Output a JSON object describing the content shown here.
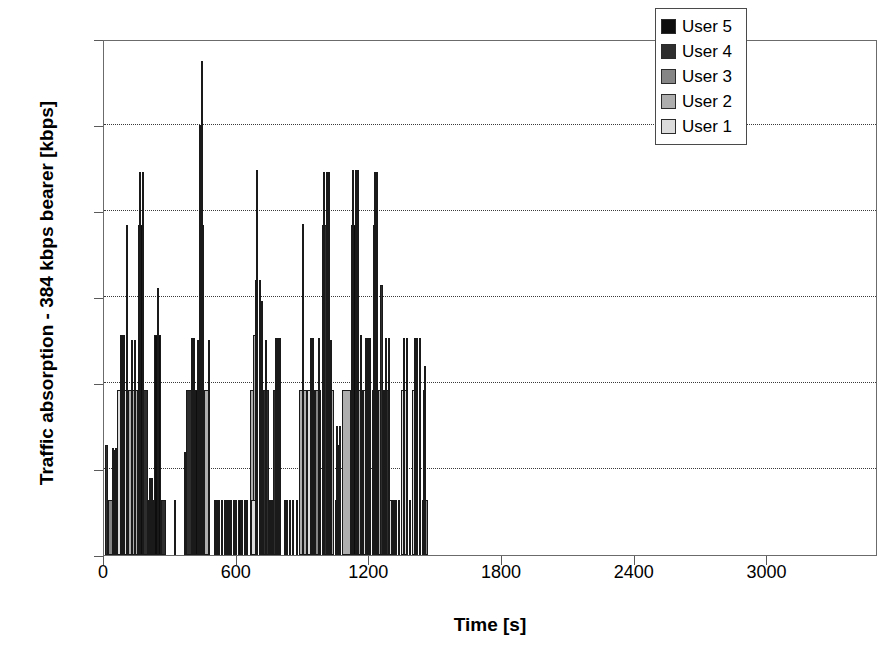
{
  "axes": {
    "ylabel": "Traffic absorption - 384 kbps bearer [kbps]",
    "xlabel": "Time [s]",
    "yticks": [
      "0",
      "200",
      "400",
      "600",
      "800",
      "1000",
      "1200"
    ],
    "xticks": [
      "0",
      "600",
      "1200",
      "1800",
      "2400",
      "3000"
    ]
  },
  "legend": {
    "items": [
      {
        "label": "User 5",
        "color": "#0d0d0d"
      },
      {
        "label": "User 4",
        "color": "#2e2e2e"
      },
      {
        "label": "User 3",
        "color": "#858585"
      },
      {
        "label": "User 2",
        "color": "#aeaeae"
      },
      {
        "label": "User 1",
        "color": "#dcdcdc"
      }
    ]
  },
  "chart_data": {
    "type": "bar",
    "title": "",
    "xlabel": "Time [s]",
    "ylabel": "Traffic absorption - 384 kbps bearer [kbps]",
    "xlim": [
      0,
      3500
    ],
    "ylim": [
      0,
      1200
    ],
    "ytick_step": 200,
    "xtick_step": 600,
    "grid": "horizontal-dotted",
    "legend_position": "top-right",
    "series_names": [
      "User 1",
      "User 2",
      "User 3",
      "User 4",
      "User 5"
    ],
    "series_colors": [
      "#dcdcdc",
      "#aeaeae",
      "#858585",
      "#2e2e2e",
      "#0d0d0d"
    ],
    "value_quantum": 128,
    "note": "Each bar is a time interval; height is aggregate kbps (multiples of 128). Color indicates which user holds the 384 kbps bearer.",
    "bars": [
      {
        "x": 5,
        "w": 14,
        "y": 256,
        "c": "#2e2e2e"
      },
      {
        "x": 12,
        "w": 6,
        "y": 128,
        "c": "#858585"
      },
      {
        "x": 20,
        "w": 30,
        "y": 128,
        "c": "#858585"
      },
      {
        "x": 34,
        "w": 5,
        "y": 250,
        "c": "#0d0d0d"
      },
      {
        "x": 44,
        "w": 4,
        "y": 245,
        "c": "#2e2e2e"
      },
      {
        "x": 52,
        "w": 4,
        "y": 250,
        "c": "#0d0d0d"
      },
      {
        "x": 60,
        "w": 48,
        "y": 384,
        "c": "#dcdcdc"
      },
      {
        "x": 72,
        "w": 5,
        "y": 512,
        "c": "#0d0d0d"
      },
      {
        "x": 80,
        "w": 5,
        "y": 512,
        "c": "#2e2e2e"
      },
      {
        "x": 88,
        "w": 5,
        "y": 512,
        "c": "#0d0d0d"
      },
      {
        "x": 98,
        "w": 5,
        "y": 768,
        "c": "#2e2e2e"
      },
      {
        "x": 108,
        "w": 44,
        "y": 384,
        "c": "#aeaeae"
      },
      {
        "x": 124,
        "w": 5,
        "y": 500,
        "c": "#0d0d0d"
      },
      {
        "x": 134,
        "w": 5,
        "y": 500,
        "c": "#2e2e2e"
      },
      {
        "x": 152,
        "w": 26,
        "y": 768,
        "c": "#0d0d0d"
      },
      {
        "x": 160,
        "w": 5,
        "y": 890,
        "c": "#0d0d0d"
      },
      {
        "x": 170,
        "w": 5,
        "y": 890,
        "c": "#0d0d0d"
      },
      {
        "x": 178,
        "w": 22,
        "y": 384,
        "c": "#2e2e2e"
      },
      {
        "x": 200,
        "w": 24,
        "y": 128,
        "c": "#0d0d0d"
      },
      {
        "x": 204,
        "w": 5,
        "y": 180,
        "c": "#2e2e2e"
      },
      {
        "x": 212,
        "w": 5,
        "y": 180,
        "c": "#0d0d0d"
      },
      {
        "x": 226,
        "w": 30,
        "y": 512,
        "c": "#0d0d0d"
      },
      {
        "x": 238,
        "w": 6,
        "y": 620,
        "c": "#0d0d0d"
      },
      {
        "x": 258,
        "w": 24,
        "y": 128,
        "c": "#2e2e2e"
      },
      {
        "x": 318,
        "w": 4,
        "y": 128,
        "c": "#858585"
      },
      {
        "x": 360,
        "w": 4,
        "y": 240,
        "c": "#0d0d0d"
      },
      {
        "x": 370,
        "w": 30,
        "y": 384,
        "c": "#2e2e2e"
      },
      {
        "x": 395,
        "w": 5,
        "y": 505,
        "c": "#0d0d0d"
      },
      {
        "x": 404,
        "w": 5,
        "y": 505,
        "c": "#2e2e2e"
      },
      {
        "x": 412,
        "w": 26,
        "y": 384,
        "c": "#0d0d0d"
      },
      {
        "x": 420,
        "w": 5,
        "y": 500,
        "c": "#0d0d0d"
      },
      {
        "x": 432,
        "w": 22,
        "y": 768,
        "c": "#0d0d0d"
      },
      {
        "x": 438,
        "w": 6,
        "y": 1150,
        "c": "#0d0d0d"
      },
      {
        "x": 428,
        "w": 3,
        "y": 1000,
        "c": "#2e2e2e"
      },
      {
        "x": 452,
        "w": 28,
        "y": 384,
        "c": "#aeaeae"
      },
      {
        "x": 470,
        "w": 5,
        "y": 500,
        "c": "#2e2e2e"
      },
      {
        "x": 496,
        "w": 4,
        "y": 128,
        "c": "#0d0d0d"
      },
      {
        "x": 506,
        "w": 4,
        "y": 128,
        "c": "#2e2e2e"
      },
      {
        "x": 516,
        "w": 4,
        "y": 128,
        "c": "#0d0d0d"
      },
      {
        "x": 530,
        "w": 4,
        "y": 128,
        "c": "#2e2e2e"
      },
      {
        "x": 542,
        "w": 4,
        "y": 128,
        "c": "#0d0d0d"
      },
      {
        "x": 552,
        "w": 4,
        "y": 128,
        "c": "#0d0d0d"
      },
      {
        "x": 560,
        "w": 4,
        "y": 128,
        "c": "#2e2e2e"
      },
      {
        "x": 572,
        "w": 4,
        "y": 128,
        "c": "#0d0d0d"
      },
      {
        "x": 582,
        "w": 4,
        "y": 128,
        "c": "#0d0d0d"
      },
      {
        "x": 592,
        "w": 4,
        "y": 128,
        "c": "#2e2e2e"
      },
      {
        "x": 604,
        "w": 14,
        "y": 128,
        "c": "#0d0d0d"
      },
      {
        "x": 620,
        "w": 4,
        "y": 128,
        "c": "#0d0d0d"
      },
      {
        "x": 632,
        "w": 4,
        "y": 128,
        "c": "#2e2e2e"
      },
      {
        "x": 644,
        "w": 4,
        "y": 128,
        "c": "#0d0d0d"
      },
      {
        "x": 660,
        "w": 34,
        "y": 384,
        "c": "#aeaeae"
      },
      {
        "x": 676,
        "w": 22,
        "y": 512,
        "c": "#aeaeae"
      },
      {
        "x": 682,
        "w": 14,
        "y": 640,
        "c": "#aeaeae"
      },
      {
        "x": 686,
        "w": 5,
        "y": 895,
        "c": "#0d0d0d"
      },
      {
        "x": 700,
        "w": 5,
        "y": 640,
        "c": "#2e2e2e"
      },
      {
        "x": 708,
        "w": 5,
        "y": 590,
        "c": "#0d0d0d"
      },
      {
        "x": 664,
        "w": 22,
        "y": 128,
        "c": "#dcdcdc"
      },
      {
        "x": 718,
        "w": 30,
        "y": 384,
        "c": "#2e2e2e"
      },
      {
        "x": 730,
        "w": 5,
        "y": 500,
        "c": "#0d0d0d"
      },
      {
        "x": 744,
        "w": 4,
        "y": 128,
        "c": "#0d0d0d"
      },
      {
        "x": 754,
        "w": 4,
        "y": 128,
        "c": "#2e2e2e"
      },
      {
        "x": 766,
        "w": 30,
        "y": 384,
        "c": "#2e2e2e"
      },
      {
        "x": 774,
        "w": 5,
        "y": 505,
        "c": "#0d0d0d"
      },
      {
        "x": 784,
        "w": 5,
        "y": 505,
        "c": "#0d0d0d"
      },
      {
        "x": 792,
        "w": 5,
        "y": 505,
        "c": "#2e2e2e"
      },
      {
        "x": 812,
        "w": 4,
        "y": 128,
        "c": "#0d0d0d"
      },
      {
        "x": 824,
        "w": 4,
        "y": 128,
        "c": "#2e2e2e"
      },
      {
        "x": 838,
        "w": 4,
        "y": 128,
        "c": "#0d0d0d"
      },
      {
        "x": 852,
        "w": 4,
        "y": 128,
        "c": "#0d0d0d"
      },
      {
        "x": 866,
        "w": 4,
        "y": 128,
        "c": "#2e2e2e"
      },
      {
        "x": 884,
        "w": 36,
        "y": 384,
        "c": "#aeaeae"
      },
      {
        "x": 894,
        "w": 5,
        "y": 770,
        "c": "#858585"
      },
      {
        "x": 920,
        "w": 34,
        "y": 384,
        "c": "#dcdcdc"
      },
      {
        "x": 930,
        "w": 5,
        "y": 505,
        "c": "#0d0d0d"
      },
      {
        "x": 942,
        "w": 5,
        "y": 505,
        "c": "#2e2e2e"
      },
      {
        "x": 956,
        "w": 26,
        "y": 384,
        "c": "#858585"
      },
      {
        "x": 966,
        "w": 5,
        "y": 505,
        "c": "#0d0d0d"
      },
      {
        "x": 984,
        "w": 28,
        "y": 768,
        "c": "#2e2e2e"
      },
      {
        "x": 992,
        "w": 5,
        "y": 890,
        "c": "#0d0d0d"
      },
      {
        "x": 1002,
        "w": 5,
        "y": 890,
        "c": "#0d0d0d"
      },
      {
        "x": 1012,
        "w": 5,
        "y": 890,
        "c": "#2e2e2e"
      },
      {
        "x": 1016,
        "w": 26,
        "y": 384,
        "c": "#aeaeae"
      },
      {
        "x": 1024,
        "w": 5,
        "y": 500,
        "c": "#0d0d0d"
      },
      {
        "x": 1046,
        "w": 22,
        "y": 128,
        "c": "#dcdcdc"
      },
      {
        "x": 1052,
        "w": 12,
        "y": 256,
        "c": "#0d0d0d"
      },
      {
        "x": 1048,
        "w": 4,
        "y": 300,
        "c": "#2e2e2e"
      },
      {
        "x": 1062,
        "w": 4,
        "y": 300,
        "c": "#0d0d0d"
      },
      {
        "x": 1078,
        "w": 40,
        "y": 384,
        "c": "#aeaeae"
      },
      {
        "x": 1118,
        "w": 26,
        "y": 768,
        "c": "#0d0d0d"
      },
      {
        "x": 1122,
        "w": 6,
        "y": 895,
        "c": "#0d0d0d"
      },
      {
        "x": 1136,
        "w": 5,
        "y": 895,
        "c": "#0d0d0d"
      },
      {
        "x": 1146,
        "w": 5,
        "y": 895,
        "c": "#2e2e2e"
      },
      {
        "x": 1150,
        "w": 20,
        "y": 384,
        "c": "#aeaeae"
      },
      {
        "x": 1156,
        "w": 10,
        "y": 512,
        "c": "#0d0d0d"
      },
      {
        "x": 1172,
        "w": 28,
        "y": 384,
        "c": "#dcdcdc"
      },
      {
        "x": 1180,
        "w": 5,
        "y": 505,
        "c": "#0d0d0d"
      },
      {
        "x": 1190,
        "w": 5,
        "y": 505,
        "c": "#2e2e2e"
      },
      {
        "x": 1200,
        "w": 5,
        "y": 505,
        "c": "#0d0d0d"
      },
      {
        "x": 1210,
        "w": 30,
        "y": 384,
        "c": "#dcdcdc"
      },
      {
        "x": 1218,
        "w": 18,
        "y": 768,
        "c": "#858585"
      },
      {
        "x": 1222,
        "w": 5,
        "y": 890,
        "c": "#858585"
      },
      {
        "x": 1232,
        "w": 5,
        "y": 890,
        "c": "#858585"
      },
      {
        "x": 1240,
        "w": 26,
        "y": 384,
        "c": "#aeaeae"
      },
      {
        "x": 1246,
        "w": 14,
        "y": 628,
        "c": "#2e2e2e"
      },
      {
        "x": 1266,
        "w": 24,
        "y": 384,
        "c": "#2e2e2e"
      },
      {
        "x": 1272,
        "w": 5,
        "y": 505,
        "c": "#0d0d0d"
      },
      {
        "x": 1284,
        "w": 5,
        "y": 505,
        "c": "#2e2e2e"
      },
      {
        "x": 1290,
        "w": 22,
        "y": 128,
        "c": "#dcdcdc"
      },
      {
        "x": 1298,
        "w": 4,
        "y": 128,
        "c": "#0d0d0d"
      },
      {
        "x": 1306,
        "w": 4,
        "y": 128,
        "c": "#2e2e2e"
      },
      {
        "x": 1314,
        "w": 4,
        "y": 128,
        "c": "#0d0d0d"
      },
      {
        "x": 1330,
        "w": 4,
        "y": 128,
        "c": "#0d0d0d"
      },
      {
        "x": 1344,
        "w": 30,
        "y": 384,
        "c": "#dcdcdc"
      },
      {
        "x": 1352,
        "w": 5,
        "y": 505,
        "c": "#0d0d0d"
      },
      {
        "x": 1366,
        "w": 5,
        "y": 505,
        "c": "#2e2e2e"
      },
      {
        "x": 1378,
        "w": 4,
        "y": 128,
        "c": "#0d0d0d"
      },
      {
        "x": 1392,
        "w": 30,
        "y": 384,
        "c": "#dcdcdc"
      },
      {
        "x": 1400,
        "w": 5,
        "y": 505,
        "c": "#0d0d0d"
      },
      {
        "x": 1412,
        "w": 5,
        "y": 505,
        "c": "#2e2e2e"
      },
      {
        "x": 1424,
        "w": 5,
        "y": 505,
        "c": "#0d0d0d"
      },
      {
        "x": 1436,
        "w": 28,
        "y": 128,
        "c": "#858585"
      },
      {
        "x": 1444,
        "w": 6,
        "y": 384,
        "c": "#858585"
      },
      {
        "x": 1448,
        "w": 4,
        "y": 440,
        "c": "#2e2e2e"
      }
    ]
  }
}
